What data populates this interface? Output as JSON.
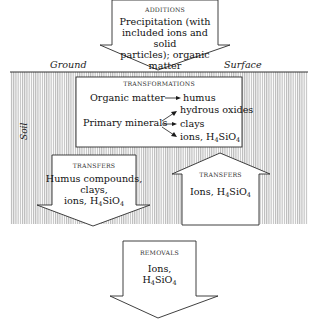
{
  "diagram": {
    "labels": {
      "ground": "Ground",
      "surface": "Surface",
      "soil": "Soil"
    },
    "additions": {
      "caption": "ADDITIONS",
      "lines": [
        "Precipitation (with",
        "included ions and solid",
        "particles); organic matter"
      ]
    },
    "transformations": {
      "caption": "TRANSFORMATIONS",
      "organic_source": "Organic matter",
      "organic_product": "humus",
      "mineral_source": "Primary minerals",
      "mineral_products": [
        "hydrous oxides",
        "clays",
        "ions, H"
      ],
      "silica_sub": "4",
      "silica_tail": "SiO",
      "silica_sub2": "4"
    },
    "transfers_down": {
      "caption": "TRANSFERS",
      "lines": [
        "Humus compounds,",
        "clays,"
      ],
      "last_prefix": "ions, H",
      "sub1": "4",
      "mid": "SiO",
      "sub2": "4"
    },
    "transfers_up": {
      "caption": "TRANSFERS",
      "prefix": "Ions,  H",
      "sub1": "4",
      "mid": "SiO",
      "sub2": "4"
    },
    "removals": {
      "caption": "REMOVALS",
      "line1": "Ions,",
      "prefix": "H",
      "sub1": "4",
      "mid": "SiO",
      "sub2": "4"
    },
    "colors": {
      "stroke": "#2a2a2a",
      "hatch": "#9a9a9a",
      "fill": "#ffffff"
    }
  }
}
